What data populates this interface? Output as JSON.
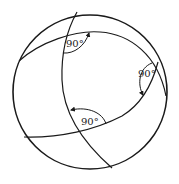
{
  "diagram": {
    "colors": {
      "stroke": "#1a1a1a",
      "background": "#ffffff",
      "label": "#222222"
    },
    "sphere": {
      "cx": 90,
      "cy": 92,
      "r": 77
    },
    "great_circles": [
      {
        "name": "upper-arc",
        "d": "M19,61 C40,42 75,30 100,32 C130,34 158,55 166,96"
      },
      {
        "name": "meridian-arc",
        "d": "M77,12 C68,28 61,50 62,80 C63,110 80,140 112,168"
      },
      {
        "name": "lower-arc",
        "d": "M24,137 C60,138 95,130 122,116 C142,104 152,85 158,62"
      }
    ],
    "angles": [
      {
        "label": "90°",
        "x": 66,
        "y": 47,
        "arc": "M63,53 C74,54 85,46 89,33",
        "arrow_at": "top"
      },
      {
        "label": "90°",
        "x": 138,
        "y": 77,
        "arc": "M152,63 C139,68 137,84 143,95",
        "arrow_at": "bottom"
      },
      {
        "label": "90°",
        "x": 81,
        "y": 125,
        "arc": "M106,124 C103,113 88,106 71,110",
        "arrow_at": "left"
      }
    ]
  }
}
